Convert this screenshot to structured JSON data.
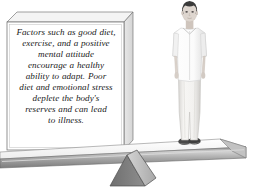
{
  "illustration": {
    "title": "Balance scale illustration with explanatory text block and standing person",
    "background_color": "#ffffff"
  },
  "text_box": {
    "name": "text-panel",
    "full_text": "Factors such as good diet, exercise, and a positive mental attitude encourage a healthy ability to adapt. Poor diet and emotional stress deplete the body's reserves and can lead to illness.",
    "lines": [
      "Factors such as good diet,",
      "exercise, and a positive",
      "mental attitude",
      "encourage a healthy",
      "ability to adapt. Poor",
      "diet and emotional stress",
      "deplete the body's",
      "reserves and can lead",
      "to illness."
    ],
    "face_color": "#ffffff",
    "top_face_color": "#f2f2f2",
    "side_face_color": "#e3e3e3",
    "outline_color": "#6e6e6e",
    "text_color": "#1a1a1a"
  },
  "person": {
    "name": "standing-person",
    "hair_color": "#3a3a3a",
    "skin_color": "#ded6cf",
    "shirt_color": "#fbfbfb",
    "shirt_shadow_color": "#dcdcdc",
    "pants_color": "#f4f3f1",
    "pants_shadow_color": "#cfcdca",
    "shoe_color": "#4a4a4a"
  },
  "plank": {
    "name": "balance-beam",
    "top_face_color": "#fafafa",
    "front_face_color": "#9a9a9a",
    "front_face_highlight": "#c9c9c9",
    "edge_color": "#6a6a6a"
  },
  "fulcrum": {
    "name": "pivot-triangle",
    "left_face_color": "#7e7e7e",
    "right_face_color": "#c4c4c4",
    "outline_color": "#555555"
  }
}
